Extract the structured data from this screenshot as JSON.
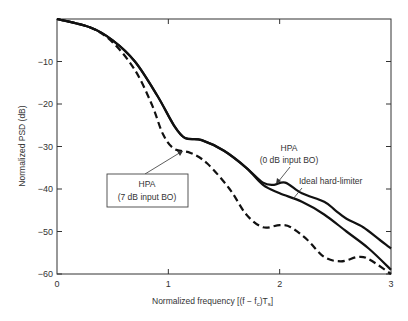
{
  "chart_data": {
    "type": "line",
    "title": "",
    "xlabel": "Normalized frequency [(f − f_c)T_s]",
    "ylabel": "Normalized PSD (dB)",
    "xlim": [
      0,
      3
    ],
    "ylim": [
      -60,
      0
    ],
    "xticks": [
      "0",
      "1",
      "2",
      "3"
    ],
    "yticks": [
      "-10",
      "-20",
      "-30",
      "-40",
      "-50",
      "-60"
    ],
    "grid": false,
    "legend": "annotations",
    "series": [
      {
        "name": "HPA (0 dB input BO)",
        "style": "solid",
        "x": [
          0,
          0.3,
          0.5,
          0.7,
          0.9,
          1.05,
          1.15,
          1.3,
          1.5,
          1.7,
          1.85,
          1.95,
          2.05,
          2.2,
          2.4,
          2.5,
          2.6,
          2.75,
          2.9,
          3.0
        ],
        "y": [
          0,
          -2,
          -5,
          -10,
          -18,
          -25,
          -28,
          -28.5,
          -31,
          -35,
          -38.5,
          -39,
          -38.5,
          -41,
          -43,
          -45,
          -47,
          -49,
          -52,
          -54
        ]
      },
      {
        "name": "Ideal hard-limiter",
        "style": "solid",
        "x": [
          0,
          0.3,
          0.5,
          0.7,
          0.9,
          1.05,
          1.15,
          1.3,
          1.5,
          1.7,
          1.85,
          2.0,
          2.2,
          2.4,
          2.6,
          2.8,
          3.0
        ],
        "y": [
          0,
          -2,
          -5,
          -10,
          -18,
          -25,
          -28,
          -28.5,
          -31,
          -35,
          -39,
          -41,
          -43,
          -46,
          -50,
          -54,
          -59
        ]
      },
      {
        "name": "HPA (7 dB input BO)",
        "style": "dashed",
        "x": [
          0,
          0.3,
          0.5,
          0.7,
          0.85,
          0.95,
          1.05,
          1.2,
          1.35,
          1.55,
          1.7,
          1.85,
          2.0,
          2.1,
          2.25,
          2.4,
          2.55,
          2.7,
          2.8,
          3.0
        ],
        "y": [
          0,
          -2,
          -5.5,
          -12,
          -20,
          -27,
          -30.5,
          -31.5,
          -34,
          -40,
          -46,
          -49,
          -48.5,
          -49,
          -52,
          -56,
          -57,
          -56,
          -56.5,
          -60
        ]
      }
    ],
    "annotations": [
      {
        "text_line1": "HPA",
        "text_line2": "(0 dB input BO)"
      },
      {
        "text": "Ideal hard-limiter"
      },
      {
        "text_line1": "HPA",
        "text_line2": "(7 dB input BO)",
        "boxed": true
      }
    ]
  },
  "labels": {
    "xlabel": "Normalized frequency [(f − f",
    "xlabel_sub_c": "c",
    "xlabel_mid": ")T",
    "xlabel_sub_s": "s",
    "xlabel_end": "]",
    "ylabel": "Normalized PSD (dB)",
    "ann_hpa0_1": "HPA",
    "ann_hpa0_2": "(0 dB input BO)",
    "ann_ideal": "Ideal hard-limiter",
    "ann_hpa7_1": "HPA",
    "ann_hpa7_2": "(7 dB input BO)"
  }
}
